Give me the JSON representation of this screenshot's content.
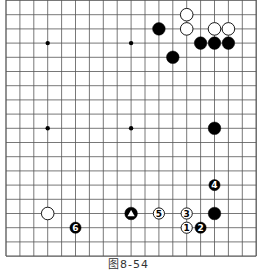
{
  "diagram": {
    "type": "go-board",
    "board_size": 19,
    "visible_rows": "0-18 (top edge cut off)",
    "caption": "图8-54",
    "colors": {
      "line": "#555555",
      "black_stone": "#000000",
      "white_stone": "#ffffff",
      "stone_outline": "#000000"
    },
    "hoshi": [
      [
        3,
        3
      ],
      [
        9,
        3
      ],
      [
        3,
        9
      ],
      [
        9,
        9
      ]
    ],
    "stones": [
      {
        "color": "black",
        "col": 11,
        "row": 2,
        "label": ""
      },
      {
        "color": "white",
        "col": 13,
        "row": 1,
        "label": ""
      },
      {
        "color": "white",
        "col": 13,
        "row": 2,
        "label": ""
      },
      {
        "color": "white",
        "col": 15,
        "row": 2,
        "label": ""
      },
      {
        "color": "white",
        "col": 16,
        "row": 2,
        "label": ""
      },
      {
        "color": "black",
        "col": 14,
        "row": 3,
        "label": ""
      },
      {
        "color": "black",
        "col": 15,
        "row": 3,
        "label": ""
      },
      {
        "color": "black",
        "col": 16,
        "row": 3,
        "label": ""
      },
      {
        "color": "black",
        "col": 12,
        "row": 4,
        "label": ""
      },
      {
        "color": "black",
        "col": 15,
        "row": 9,
        "label": ""
      },
      {
        "color": "black",
        "col": 15,
        "row": 13,
        "label": "4"
      },
      {
        "color": "black",
        "col": 15,
        "row": 15,
        "label": ""
      },
      {
        "color": "black",
        "col": 14,
        "row": 16,
        "label": "2"
      },
      {
        "color": "white",
        "col": 3,
        "row": 15,
        "label": ""
      },
      {
        "color": "black",
        "col": 5,
        "row": 16,
        "label": "6"
      },
      {
        "color": "black",
        "col": 9,
        "row": 15,
        "label": "",
        "marker": "triangle"
      },
      {
        "color": "white",
        "col": 11,
        "row": 15,
        "label": "5"
      },
      {
        "color": "white",
        "col": 13,
        "row": 15,
        "label": "3"
      },
      {
        "color": "white",
        "col": 13,
        "row": 16,
        "label": "1"
      }
    ]
  }
}
